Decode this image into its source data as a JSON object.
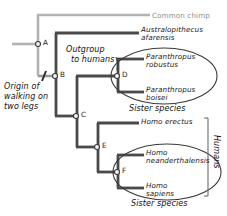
{
  "diagram": {
    "colors": {
      "branch_dark": "#4a4a4a",
      "branch_gray": "#b2b2b2",
      "text": "#1b1b1b",
      "text_gray": "#8d8d8d",
      "outline": "#3a3a3a",
      "background": "#ffffff"
    }
  },
  "taxa": [
    {
      "id": "common-chimp",
      "label": "Common chimp",
      "style": "gray",
      "x": 152,
      "y": 17
    },
    {
      "id": "australopithecus",
      "label_line1": "Australopithecus",
      "label_line2": "afarensis",
      "style": "italic",
      "x": 141,
      "y": 33
    },
    {
      "id": "paranthropus-robustus",
      "label_line1": "Paranthropus",
      "label_line2": "robustus",
      "style": "italic",
      "x": 146,
      "y": 59
    },
    {
      "id": "paranthropus-boisei",
      "label_line1": "Paranthropus",
      "label_line2": "boisei",
      "style": "italic",
      "x": 146,
      "y": 85
    },
    {
      "id": "homo-erectus",
      "label_line1": "Homo erectus",
      "label_line2": "",
      "style": "italic",
      "x": 141,
      "y": 122
    },
    {
      "id": "homo-neanderthalensis",
      "label_line1": "Homo",
      "label_line2": "neanderthalensis",
      "style": "italic",
      "x": 146,
      "y": 142
    },
    {
      "id": "homo-sapiens",
      "label_line1": "Homo",
      "label_line2": "sapiens",
      "style": "italic",
      "x": 146,
      "y": 168
    }
  ],
  "nodes": [
    {
      "id": "A",
      "label": "A",
      "x": 38,
      "y": 44
    },
    {
      "id": "B",
      "label": "B",
      "x": 55,
      "y": 76
    },
    {
      "id": "C",
      "label": "C",
      "x": 76,
      "y": 116
    },
    {
      "id": "D",
      "label": "D",
      "x": 117,
      "y": 76
    },
    {
      "id": "E",
      "label": "E",
      "x": 97,
      "y": 147
    },
    {
      "id": "F",
      "label": "F",
      "x": 117,
      "y": 172
    }
  ],
  "annotations": {
    "origin": {
      "id": "origin-of-walking",
      "line1": "Origin of",
      "line2": "walking on",
      "line3": "two legs",
      "x": 4,
      "y": 80
    },
    "outgroup": {
      "id": "outgroup-to-humans",
      "line1": "Outgroup",
      "line2": "to humans",
      "x": 66,
      "y": 47
    },
    "sister_species_top": {
      "id": "sister-species-paranthropus",
      "label": "Sister species",
      "x": 131,
      "y": 104
    },
    "sister_species_bottom": {
      "id": "sister-species-homo",
      "label": "Sister species",
      "x": 133,
      "y": 200
    },
    "humans": {
      "id": "humans-bracket-label",
      "label": "Humans",
      "x": 214,
      "y": 138
    }
  }
}
